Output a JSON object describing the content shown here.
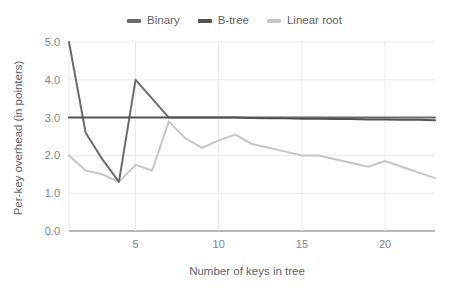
{
  "chart_data": {
    "type": "line",
    "title": "",
    "subtitle": "",
    "xlabel": "Number of keys in tree",
    "ylabel": "Per-key overhead (in pointers)",
    "xlim": [
      1,
      23
    ],
    "ylim": [
      0.0,
      5.0
    ],
    "xticks": [
      5,
      10,
      15,
      20
    ],
    "xtick_labels": [
      "5",
      "10",
      "15",
      "20"
    ],
    "yticks": [
      0.0,
      1.0,
      2.0,
      3.0,
      4.0,
      5.0
    ],
    "ytick_labels": [
      "0.0",
      "1.0",
      "2.0",
      "3.0",
      "4.0",
      "5.0"
    ],
    "grid": true,
    "grid_axis": "both",
    "legend_position": "top-center",
    "x": [
      1,
      2,
      3,
      4,
      5,
      6,
      7,
      8,
      9,
      10,
      11,
      12,
      13,
      14,
      15,
      16,
      17,
      18,
      19,
      20,
      21,
      22,
      23
    ],
    "series": [
      {
        "name": "Binary",
        "color": "#6b6b6b",
        "values": [
          5.0,
          2.6,
          1.9,
          1.3,
          4.0,
          3.5,
          3.0,
          3.0,
          3.0,
          3.0,
          3.0,
          3.0,
          3.0,
          3.0,
          3.0,
          3.0,
          3.0,
          3.0,
          3.0,
          3.0,
          3.0,
          3.0,
          3.0
        ]
      },
      {
        "name": "B-tree",
        "color": "#525252",
        "values": [
          3.0,
          3.0,
          3.0,
          3.0,
          3.0,
          3.0,
          3.0,
          3.0,
          3.0,
          3.0,
          3.0,
          2.99,
          2.98,
          2.98,
          2.97,
          2.97,
          2.96,
          2.96,
          2.95,
          2.95,
          2.94,
          2.94,
          2.93
        ]
      },
      {
        "name": "Linear root",
        "color": "#c6c6c6",
        "values": [
          2.0,
          1.6,
          1.5,
          1.3,
          1.75,
          1.6,
          2.9,
          2.45,
          2.2,
          2.4,
          2.55,
          2.3,
          2.2,
          2.1,
          2.0,
          2.0,
          1.9,
          1.8,
          1.7,
          1.85,
          1.7,
          1.55,
          1.4
        ]
      }
    ]
  },
  "legend": {
    "entries": [
      {
        "label": "Binary"
      },
      {
        "label": "B-tree"
      },
      {
        "label": "Linear root"
      }
    ]
  },
  "axes": {
    "x_title": "Number of keys in tree",
    "y_title": "Per-key overhead (in pointers)"
  },
  "colors": {
    "background": "#ffffff",
    "grid": "#e8eaed",
    "axis_line": "#9aa0a6",
    "tick_text": "#80868b",
    "title_text": "#5f6368",
    "binary": "#6b6b6b",
    "btree": "#525252",
    "linear_root": "#c6c6c6"
  }
}
